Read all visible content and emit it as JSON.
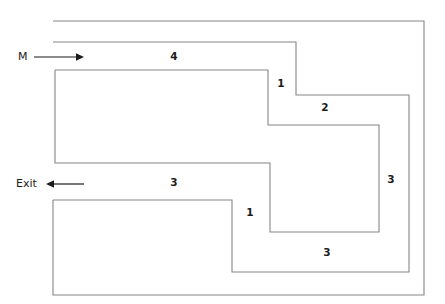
{
  "figure": {
    "background_color": "#ffffff",
    "wall_color": "#868686",
    "label_color": "#1b1b1b",
    "ports": [
      {
        "name": "inlet",
        "label": "M",
        "label_x": 18,
        "label_y": 57,
        "arrow_direction": "right",
        "arrow_x1": 34,
        "arrow_x2": 82,
        "arrow_y": 57
      },
      {
        "name": "outlet",
        "label": "Exit",
        "label_x": 16,
        "label_y": 184,
        "arrow_direction": "left",
        "arrow_x1": 82,
        "arrow_x2": 48,
        "arrow_y": 184
      }
    ],
    "segment_labels": [
      {
        "name": "segment-4",
        "text": "4",
        "x": 174,
        "y": 57
      },
      {
        "name": "segment-1-upper",
        "text": "1",
        "x": 281,
        "y": 84
      },
      {
        "name": "segment-2",
        "text": "2",
        "x": 325,
        "y": 108
      },
      {
        "name": "segment-3-right",
        "text": "3",
        "x": 391,
        "y": 180
      },
      {
        "name": "segment-3-left",
        "text": "3",
        "x": 174,
        "y": 183
      },
      {
        "name": "segment-1-lower",
        "text": "1",
        "x": 250,
        "y": 213
      },
      {
        "name": "segment-3-bottom",
        "text": "3",
        "x": 327,
        "y": 253
      }
    ],
    "paths": {
      "outer_boundary": "M 53 21 L 424 21 L 424 295 L 53 295 L 53 200",
      "upper_channel_wall": "M 53 42 L 296 42 L 296 95 L 409 95 L 409 272 L 232 272 L 232 200 L 53 200",
      "inner_spiral_wall": "M 55 70 L 268 70 L 268 125 L 379 125 L 379 232 L 270 232 L 270 163 L 55 163 L 55 70"
    }
  }
}
